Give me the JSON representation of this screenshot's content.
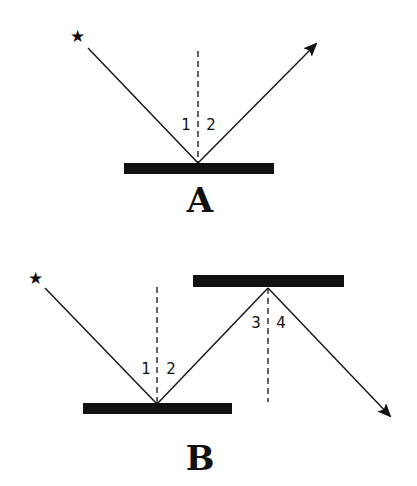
{
  "diagrams": [
    {
      "label": "A",
      "angle_labels": [
        "1",
        "2"
      ],
      "description": "Single mirror reflection: ray from star reflects off horizontal mirror"
    },
    {
      "label": "B",
      "angle_labels": [
        "1",
        "2",
        "3",
        "4"
      ],
      "description": "Double mirror reflection: ray from star reflects off lower mirror then upper mirror"
    }
  ],
  "icons": {
    "source": "star-icon",
    "glyph": "★"
  },
  "colors": {
    "ink": "#111111",
    "background": "#ffffff"
  }
}
